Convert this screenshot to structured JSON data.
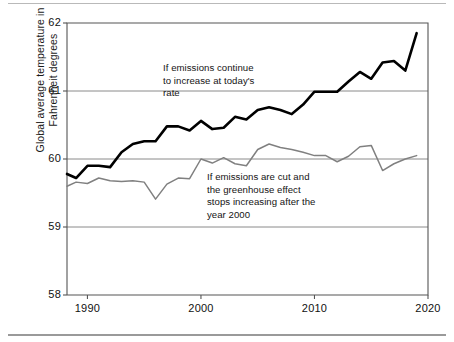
{
  "figure": {
    "background_color": "#ffffff",
    "frame_color": "#555555"
  },
  "axes": {
    "y_title_line1": "Global average temperature in",
    "y_title_line2": "Fahrenheit degrees",
    "y_title": "Global average temperature in\nFahrenheit degrees",
    "y_ticks": [
      "58",
      "59",
      "60",
      "61",
      "62"
    ],
    "x_ticks": [
      "1990",
      "2000",
      "2010",
      "2020"
    ],
    "x_title": ""
  },
  "annotations": {
    "upper": "If emissions continue\nto increase at today's\nrate",
    "lower": "If emissions are cut and\nthe greenhouse effect\nstops increasing after the\nyear 2000"
  },
  "chart_data": {
    "type": "line",
    "title": "",
    "xlabel": "",
    "ylabel": "Global average temperature in Fahrenheit degrees",
    "xlim": [
      1988.2,
      2020
    ],
    "ylim": [
      58,
      62
    ],
    "xticks": [
      1990,
      2000,
      2010,
      2020
    ],
    "yticks": [
      58,
      59,
      60,
      61,
      62
    ],
    "grid": "horizontal",
    "legend": "none",
    "annotations": [
      {
        "text": "If emissions continue\nto increase at today's\nrate",
        "series": "If emissions continue to increase at today's rate",
        "x": 1998.0,
        "y": 61.35
      },
      {
        "text": "If emissions are cut and\nthe greenhouse effect\nstops increasing after the\nyear 2000",
        "series": "If emissions are cut and the greenhouse effect stops increasing after the year 2000",
        "x": 2002.0,
        "y": 59.75
      }
    ],
    "x": [
      1988.2,
      1989,
      1990,
      1991,
      1992,
      1993,
      1994,
      1995,
      1996,
      1997,
      1998,
      1999,
      2000,
      2001,
      2002,
      2003,
      2004,
      2005,
      2006,
      2007,
      2008,
      2009,
      2010,
      2011,
      2012,
      2013,
      2014,
      2015,
      2016,
      2017,
      2018,
      2019
    ],
    "series": [
      {
        "name": "If emissions continue to increase at today's rate",
        "color": "#000000",
        "width": 2.6,
        "values": [
          59.78,
          59.72,
          59.9,
          59.9,
          59.88,
          60.1,
          60.22,
          60.26,
          60.26,
          60.48,
          60.48,
          60.42,
          60.56,
          60.44,
          60.46,
          60.62,
          60.58,
          60.72,
          60.76,
          60.72,
          60.66,
          60.8,
          60.99,
          60.99,
          60.99,
          61.14,
          61.28,
          61.18,
          61.42,
          61.44,
          61.3,
          61.85
        ]
      },
      {
        "name": "If emissions are cut and the greenhouse effect stops increasing after the year 2000",
        "color": "#808080",
        "width": 1.5,
        "values": [
          59.6,
          59.66,
          59.64,
          59.72,
          59.68,
          59.67,
          59.68,
          59.66,
          59.41,
          59.63,
          59.72,
          59.71,
          60.0,
          59.94,
          60.02,
          59.93,
          59.9,
          60.14,
          60.22,
          60.17,
          60.14,
          60.1,
          60.05,
          60.05,
          59.96,
          60.04,
          60.18,
          60.2,
          59.83,
          59.93,
          60.0,
          60.05
        ]
      }
    ]
  }
}
